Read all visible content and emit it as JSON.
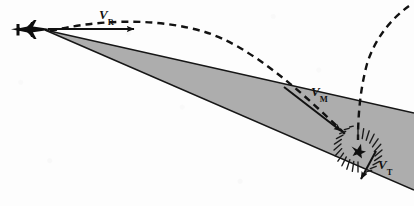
{
  "diagram": {
    "type": "missile-intercept-geometry-diagram",
    "background_color": "#fdfdfd",
    "beam_fill_color": "#a9a9a9",
    "stroke_color": "#111111",
    "width": 414,
    "height": 206,
    "labels": {
      "velocity_radar": {
        "symbol": "V",
        "subscript": "R",
        "x": 99,
        "y": 8
      },
      "velocity_missile": {
        "symbol": "V",
        "subscript": "M",
        "x": 311,
        "y": 85
      },
      "velocity_target": {
        "symbol": "V",
        "subscript": "T",
        "x": 378,
        "y": 158
      }
    },
    "elements": {
      "aircraft": {
        "name": "aircraft-silhouette",
        "x": 10,
        "y": 20,
        "width": 42,
        "height": 20
      },
      "radar_beam_wedge": {
        "name": "radar-beam-wedge",
        "apex_x": 45,
        "apex_y": 30,
        "top_edge_end_x": 414,
        "top_edge_end_y": 113,
        "bottom_edge_end_x": 414,
        "bottom_edge_end_y": 190
      },
      "burst": {
        "name": "intercept-burst",
        "center_x": 358,
        "center_y": 150,
        "inner_radius": 6,
        "outer_radius": 22,
        "ray_count": 24
      },
      "vr_arrow": {
        "name": "vr-velocity-arrow",
        "x1": 48,
        "y1": 29,
        "x2": 134,
        "y2": 29
      },
      "vm_arrow": {
        "name": "vm-velocity-arrow",
        "x1": 284,
        "y1": 87,
        "x2": 341,
        "y2": 131
      },
      "vt_arrow": {
        "name": "vt-velocity-arrow",
        "x1": 376,
        "y1": 151,
        "x2": 361,
        "y2": 179
      },
      "missile_trajectory": {
        "name": "missile-dashed-trajectory",
        "path": "M 50,31 C 110,17 165,20 205,32 C 250,46 300,90 345,134",
        "dash": "7 5"
      },
      "target_trajectory": {
        "name": "target-dashed-trajectory",
        "path": "M 409,6 C 392,18 375,38 367,64 C 360,90 358,116 358,140",
        "dash": "7 5"
      }
    }
  }
}
